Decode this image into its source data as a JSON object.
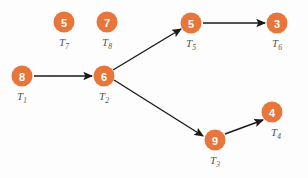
{
  "diagram": {
    "background_color": "#fdfdfd",
    "node_color": "#e8763a",
    "node_text_color": "#ffffff",
    "label_color": "#555555",
    "edge_color": "#1a1a1a",
    "node_radius": 10.5,
    "nodes": [
      {
        "id": "T1",
        "value": "8",
        "label_base": "T",
        "label_sub": "1",
        "cx": 22,
        "cy": 76,
        "label_x": 22,
        "label_y": 100
      },
      {
        "id": "T2",
        "value": "6",
        "label_base": "T",
        "label_sub": "2",
        "cx": 104,
        "cy": 76,
        "label_x": 104,
        "label_y": 100
      },
      {
        "id": "T3",
        "value": "9",
        "label_base": "T",
        "label_sub": "3",
        "cx": 215,
        "cy": 140,
        "label_x": 215,
        "label_y": 164
      },
      {
        "id": "T4",
        "value": "4",
        "label_base": "T",
        "label_sub": "4",
        "cx": 272,
        "cy": 112,
        "label_x": 276,
        "label_y": 136
      },
      {
        "id": "T5",
        "value": "5",
        "label_base": "T",
        "label_sub": "5",
        "cx": 191,
        "cy": 23,
        "label_x": 191,
        "label_y": 47
      },
      {
        "id": "T6",
        "value": "3",
        "label_base": "T",
        "label_sub": "6",
        "cx": 277,
        "cy": 23,
        "label_x": 277,
        "label_y": 47
      },
      {
        "id": "T7",
        "value": "5",
        "label_base": "T",
        "label_sub": "7",
        "cx": 64,
        "cy": 22,
        "label_x": 64,
        "label_y": 46
      },
      {
        "id": "T8",
        "value": "7",
        "label_base": "T",
        "label_sub": "8",
        "cx": 107,
        "cy": 22,
        "label_x": 107,
        "label_y": 46
      }
    ],
    "edges": [
      {
        "id": "edge-t1-t2",
        "from": "T1",
        "to": "T2",
        "x1": 34,
        "y1": 76,
        "x2": 92,
        "y2": 76
      },
      {
        "id": "edge-t2-t5",
        "from": "T2",
        "to": "T5",
        "x1": 113,
        "y1": 70,
        "x2": 181,
        "y2": 29
      },
      {
        "id": "edge-t2-t3",
        "from": "T2",
        "to": "T3",
        "x1": 114,
        "y1": 80,
        "x2": 203,
        "y2": 136
      },
      {
        "id": "edge-t3-t4",
        "from": "T3",
        "to": "T4",
        "x1": 225,
        "y1": 134,
        "x2": 263,
        "y2": 120
      },
      {
        "id": "edge-t5-t6",
        "from": "T5",
        "to": "T6",
        "x1": 203,
        "y1": 23,
        "x2": 265,
        "y2": 23
      }
    ]
  }
}
